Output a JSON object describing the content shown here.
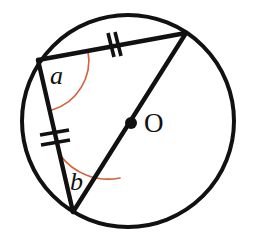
{
  "figure": {
    "background_color": "#ffffff",
    "stroke_color": "#111111",
    "arc_color": "#d4633c",
    "stroke_width": 4,
    "arc_stroke_width": 1.6
  },
  "circle": {
    "name": "circle-outline",
    "cx": 128,
    "cy": 121,
    "r": 106
  },
  "center_point": {
    "name": "center-dot",
    "cx": 131,
    "cy": 123,
    "r": 5.5,
    "label": "O",
    "label_x": 144,
    "label_y": 131,
    "label_font_size": 27
  },
  "vertices": {
    "top_left": {
      "name": "vertex-top-left",
      "x": 38,
      "y": 60
    },
    "top_right": {
      "name": "vertex-top-right",
      "x": 186,
      "y": 33
    },
    "bottom": {
      "name": "vertex-bottom",
      "x": 73,
      "y": 212
    }
  },
  "segments": [
    {
      "name": "chord-top",
      "from": "top_left",
      "to": "top_right",
      "d": "M 38 60 L 186 33",
      "tick_marks": 2
    },
    {
      "name": "chord-left",
      "from": "top_left",
      "to": "bottom",
      "d": "M 38 60 L 73 212",
      "tick_marks": 2
    },
    {
      "name": "diameter",
      "from": "top_right",
      "to": "bottom",
      "d": "M 186 33 L 73 212",
      "tick_marks": 0
    }
  ],
  "tick_marks": [
    {
      "name": "tick-mark-top-chord",
      "count": 2,
      "x": 113,
      "y": 45,
      "lines": [
        "M 108 33 L 114 57",
        "M 115 32 L 121 56"
      ]
    },
    {
      "name": "tick-mark-left-chord",
      "count": 2,
      "x": 54,
      "y": 141,
      "lines": [
        "M 40 136 L 68 131",
        "M 41 145 L 69 140"
      ]
    }
  ],
  "angles": [
    {
      "name": "angle-a",
      "label": "a",
      "vertex": "top_left",
      "arc_path": "M 88 51 A 52 52 0 0 1 52 110",
      "label_x": 50,
      "label_y": 84,
      "label_font_size": 26
    },
    {
      "name": "angle-b",
      "label": "b",
      "vertex": "bottom",
      "arc_path": "M 60 155 A 60 60 0 0 0 120 178",
      "label_x": 70,
      "label_y": 189,
      "label_font_size": 26
    }
  ]
}
